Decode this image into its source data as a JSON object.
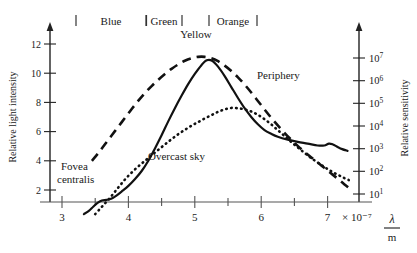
{
  "chart_data": {
    "type": "line",
    "title": "",
    "xlabel": "λ / m",
    "x_unit_factor": "× 10⁻⁷",
    "xlim": [
      2.85,
      7.35
    ],
    "x_ticks": [
      3,
      4,
      5,
      6,
      7
    ],
    "x_tick_labels": [
      "3",
      "4",
      "5",
      "6",
      "7"
    ],
    "x_minor_ticks": [
      3.5,
      4.5,
      5.5,
      6.5
    ],
    "ylabel_left": "Relative light intensity",
    "ylim_left": [
      0.4,
      13.4
    ],
    "y_ticks_left": [
      2,
      4,
      6,
      8,
      10,
      12
    ],
    "y_tick_labels_left": [
      "2",
      "4",
      "6",
      "8",
      "10",
      "12"
    ],
    "ylabel_right": "Relative sensitivity",
    "y_right_scale": "log",
    "y_ticks_right_exponents": [
      1,
      2,
      3,
      4,
      5,
      6,
      7
    ],
    "y_tick_labels_right": [
      "10¹",
      "10²",
      "10³",
      "10⁴",
      "10⁵",
      "10⁶",
      "10⁷"
    ],
    "grid": false,
    "legend_position": "inline-annotations",
    "series": [
      {
        "name": "Overcast sky",
        "style": "solid",
        "label_x": 4.75,
        "label_y": 3.5,
        "points": [
          [
            3.33,
            0.35
          ],
          [
            3.4,
            0.55
          ],
          [
            3.47,
            0.85
          ],
          [
            3.53,
            1.1
          ],
          [
            3.6,
            1.28
          ],
          [
            3.67,
            1.32
          ],
          [
            3.74,
            1.4
          ],
          [
            3.82,
            1.62
          ],
          [
            3.9,
            1.9
          ],
          [
            4.0,
            2.28
          ],
          [
            4.1,
            2.75
          ],
          [
            4.2,
            3.3
          ],
          [
            4.3,
            4.0
          ],
          [
            4.4,
            4.85
          ],
          [
            4.5,
            5.75
          ],
          [
            4.6,
            6.7
          ],
          [
            4.7,
            7.6
          ],
          [
            4.8,
            8.45
          ],
          [
            4.9,
            9.25
          ],
          [
            5.0,
            9.95
          ],
          [
            5.1,
            10.55
          ],
          [
            5.18,
            10.88
          ],
          [
            5.26,
            10.85
          ],
          [
            5.35,
            10.45
          ],
          [
            5.45,
            9.8
          ],
          [
            5.55,
            9.05
          ],
          [
            5.65,
            8.3
          ],
          [
            5.75,
            7.6
          ],
          [
            5.85,
            7.0
          ],
          [
            5.95,
            6.5
          ],
          [
            6.05,
            6.1
          ],
          [
            6.15,
            5.85
          ],
          [
            6.25,
            5.65
          ],
          [
            6.4,
            5.45
          ],
          [
            6.55,
            5.3
          ],
          [
            6.7,
            5.18
          ],
          [
            6.85,
            5.05
          ],
          [
            6.95,
            5.05
          ],
          [
            7.02,
            5.18
          ],
          [
            7.08,
            5.12
          ],
          [
            7.15,
            4.95
          ],
          [
            7.22,
            4.8
          ],
          [
            7.3,
            4.68
          ]
        ]
      },
      {
        "name": "Periphery",
        "style": "dashed",
        "label_x": 5.95,
        "label_y": 9.6,
        "points": [
          [
            3.45,
            4.0
          ],
          [
            3.55,
            4.55
          ],
          [
            3.65,
            5.15
          ],
          [
            3.75,
            5.75
          ],
          [
            3.85,
            6.35
          ],
          [
            3.95,
            6.95
          ],
          [
            4.05,
            7.55
          ],
          [
            4.15,
            8.12
          ],
          [
            4.25,
            8.65
          ],
          [
            4.35,
            9.12
          ],
          [
            4.45,
            9.55
          ],
          [
            4.55,
            9.95
          ],
          [
            4.65,
            10.3
          ],
          [
            4.75,
            10.6
          ],
          [
            4.85,
            10.85
          ],
          [
            4.95,
            11.02
          ],
          [
            5.05,
            11.12
          ],
          [
            5.15,
            11.12
          ],
          [
            5.25,
            11.02
          ],
          [
            5.35,
            10.82
          ],
          [
            5.45,
            10.52
          ],
          [
            5.55,
            10.15
          ],
          [
            5.65,
            9.72
          ],
          [
            5.75,
            9.22
          ],
          [
            5.85,
            8.68
          ],
          [
            5.95,
            8.1
          ],
          [
            6.05,
            7.52
          ],
          [
            6.15,
            6.95
          ],
          [
            6.25,
            6.42
          ],
          [
            6.35,
            5.92
          ],
          [
            6.45,
            5.45
          ],
          [
            6.55,
            5.02
          ],
          [
            6.65,
            4.62
          ],
          [
            6.75,
            4.25
          ],
          [
            6.85,
            3.88
          ],
          [
            6.95,
            3.52
          ],
          [
            7.05,
            3.15
          ],
          [
            7.15,
            2.78
          ],
          [
            7.25,
            2.4
          ],
          [
            7.32,
            2.15
          ]
        ]
      },
      {
        "name": "Fovea centralis",
        "style": "dotted",
        "label_x": 3.25,
        "label_y": 2.6,
        "points": [
          [
            3.5,
            0.35
          ],
          [
            3.57,
            0.7
          ],
          [
            3.64,
            1.05
          ],
          [
            3.72,
            1.45
          ],
          [
            3.8,
            1.9
          ],
          [
            3.88,
            2.35
          ],
          [
            3.96,
            2.78
          ],
          [
            4.05,
            3.2
          ],
          [
            4.15,
            3.62
          ],
          [
            4.25,
            4.0
          ],
          [
            4.35,
            4.38
          ],
          [
            4.45,
            4.75
          ],
          [
            4.55,
            5.12
          ],
          [
            4.65,
            5.48
          ],
          [
            4.75,
            5.82
          ],
          [
            4.85,
            6.12
          ],
          [
            4.95,
            6.4
          ],
          [
            5.05,
            6.65
          ],
          [
            5.15,
            6.9
          ],
          [
            5.25,
            7.12
          ],
          [
            5.35,
            7.35
          ],
          [
            5.45,
            7.52
          ],
          [
            5.55,
            7.62
          ],
          [
            5.65,
            7.6
          ],
          [
            5.75,
            7.52
          ],
          [
            5.85,
            7.38
          ],
          [
            5.95,
            7.15
          ],
          [
            6.05,
            6.85
          ],
          [
            6.15,
            6.5
          ],
          [
            6.25,
            6.1
          ],
          [
            6.35,
            5.7
          ],
          [
            6.45,
            5.3
          ],
          [
            6.55,
            4.92
          ],
          [
            6.65,
            4.55
          ],
          [
            6.75,
            4.2
          ],
          [
            6.85,
            3.88
          ],
          [
            6.95,
            3.58
          ],
          [
            7.05,
            3.3
          ],
          [
            7.15,
            3.05
          ],
          [
            7.25,
            2.82
          ],
          [
            7.32,
            2.68
          ]
        ]
      }
    ],
    "bands": [
      {
        "label": "Blue",
        "tick_left": 3.22,
        "tick_right": 4.28,
        "label_x": 3.75
      },
      {
        "label": "Green",
        "tick_left": 4.28,
        "tick_right": 4.82,
        "label_x": 4.55
      },
      {
        "label": "Orange",
        "tick_left": 5.22,
        "tick_right": 5.95,
        "label_x": 5.6
      },
      {
        "label": "Yellow",
        "tick_left": null,
        "tick_right": null,
        "label_x": 4.95
      }
    ],
    "annotations": [
      {
        "text": "Fovea centralis",
        "for": "Fovea centralis"
      },
      {
        "text": "Overcast sky",
        "for": "Overcast sky"
      },
      {
        "text": "Periphery",
        "for": "Periphery"
      }
    ],
    "colors": {
      "ink": "#111111",
      "axis": "#333333",
      "background": "#ffffff"
    }
  },
  "labels": {
    "y_left_title": "Relative light intensity",
    "y_right_title": "Relative sensitivity",
    "x_unit_factor": "× 10⁻⁷",
    "lambda": "λ",
    "meter": "m",
    "band_blue": "Blue",
    "band_green": "Green",
    "band_yellow": "Yellow",
    "band_orange": "Orange",
    "curve_fovea_line1": "Fovea",
    "curve_fovea_line2": "centralis",
    "curve_overcast": "Overcast sky",
    "curve_periphery": "Periphery",
    "xt0": "3",
    "xt1": "4",
    "xt2": "5",
    "xt3": "6",
    "xt4": "7",
    "ylt0": "2",
    "ylt1": "4",
    "ylt2": "6",
    "ylt3": "8",
    "ylt4": "10",
    "ylt5": "12",
    "yr0": "10",
    "yr1": "10",
    "yr2": "10",
    "yr3": "10",
    "yr4": "10",
    "yr5": "10",
    "yr6": "10",
    "yre0": "1",
    "yre1": "2",
    "yre2": "3",
    "yre3": "4",
    "yre4": "5",
    "yre5": "6",
    "yre6": "7"
  }
}
